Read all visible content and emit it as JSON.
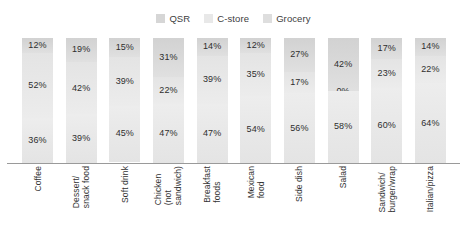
{
  "chart_data": {
    "type": "bar",
    "variant": "stacked-100",
    "orientation": "vertical",
    "title": "",
    "subtitle": "",
    "xlabel": "",
    "ylabel": "",
    "ylim": [
      0,
      100
    ],
    "grid": false,
    "legend_position": "top-center",
    "value_suffix": "%",
    "categories": [
      "Coffee",
      "Dessert/\nsnack food",
      "Soft drink",
      "Chicken\n(not\nsandwich)",
      "Breakfast\nfoods",
      "Mexican\nfood",
      "Side dish",
      "Salad",
      "Sandwich/\nburger/wrap",
      "Italian/pizza"
    ],
    "series": [
      {
        "name": "QSR",
        "color": "#d6d6d6",
        "values": [
          12,
          19,
          15,
          31,
          14,
          12,
          27,
          42,
          17,
          14
        ],
        "labels": [
          "12%",
          "19%",
          "15%",
          "31%",
          "14%",
          "12%",
          "27%",
          "42%",
          "17%",
          "14%"
        ]
      },
      {
        "name": "C-store",
        "color": "#e8e8e8",
        "values": [
          52,
          42,
          39,
          22,
          39,
          35,
          17,
          0,
          23,
          22
        ],
        "labels": [
          "52%",
          "42%",
          "39%",
          "22%",
          "39%",
          "35%",
          "17%",
          "0%",
          "23%",
          "22%"
        ]
      },
      {
        "name": "Grocery",
        "color": "#eaeaea",
        "values": [
          36,
          39,
          45,
          47,
          47,
          54,
          56,
          58,
          60,
          64
        ],
        "labels": [
          "36%",
          "39%",
          "45%",
          "47%",
          "47%",
          "54%",
          "56%",
          "58%",
          "60%",
          "64%"
        ]
      }
    ]
  },
  "legend": {
    "items": [
      {
        "label": "QSR",
        "color": "#d6d6d6"
      },
      {
        "label": "C-store",
        "color": "#e8e8e8"
      },
      {
        "label": "Grocery",
        "color": "#dedede"
      }
    ]
  }
}
